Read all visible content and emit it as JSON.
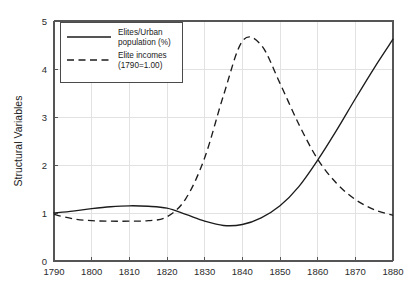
{
  "chart_data": {
    "type": "line",
    "title": "",
    "subtitle": "",
    "xlabel": "",
    "ylabel": "Structural Variables",
    "xlim": [
      1790,
      1880
    ],
    "ylim": [
      0,
      5
    ],
    "grid": true,
    "legend_position": "upper-left",
    "xticks": [
      "1790",
      "1800",
      "1810",
      "1820",
      "1830",
      "1840",
      "1850",
      "1860",
      "1870",
      "1880"
    ],
    "xtick_values": [
      1790,
      1800,
      1810,
      1820,
      1830,
      1840,
      1850,
      1860,
      1870,
      1880
    ],
    "yticks": [
      "0",
      "1",
      "2",
      "3",
      "4",
      "5"
    ],
    "ytick_values": [
      0,
      1,
      2,
      3,
      4,
      5
    ],
    "x": [
      1790,
      1795,
      1800,
      1805,
      1810,
      1815,
      1820,
      1825,
      1830,
      1835,
      1840,
      1845,
      1850,
      1855,
      1860,
      1865,
      1870,
      1875,
      1880
    ],
    "series": [
      {
        "name": "Elites/Urban population (%)",
        "style": "solid",
        "color": "#1c1c1c",
        "values": [
          1.0,
          1.04,
          1.09,
          1.13,
          1.15,
          1.14,
          1.1,
          0.97,
          0.83,
          0.74,
          0.76,
          0.9,
          1.15,
          1.55,
          2.1,
          2.72,
          3.38,
          4.02,
          4.62
        ]
      },
      {
        "name": "Elite incomes (1790=1.00)",
        "style": "dashed",
        "color": "#1c1c1c",
        "values": [
          0.97,
          0.88,
          0.84,
          0.83,
          0.83,
          0.84,
          0.92,
          1.3,
          2.15,
          3.45,
          4.58,
          4.5,
          3.7,
          2.85,
          2.12,
          1.62,
          1.28,
          1.07,
          0.95
        ]
      }
    ],
    "annotations": []
  },
  "legend": {
    "entries": [
      {
        "label_line1": "Elites/Urban",
        "label_line2": "population (%)",
        "style": "solid"
      },
      {
        "label_line1": "Elite incomes",
        "label_line2": "(1790=1.00)",
        "style": "dashed"
      }
    ]
  },
  "axes": {
    "y_title": "Structural Variables"
  }
}
